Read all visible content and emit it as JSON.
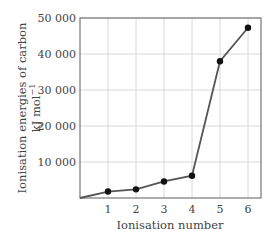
{
  "chart_data": {
    "type": "line",
    "title": "",
    "xlabel": "Ionisation number",
    "ylabel_line1": "Ionisation energies of carbon",
    "ylabel_line2": "kJ mol",
    "ylabel_superscript": "−1",
    "x": [
      0,
      1,
      2,
      3,
      4,
      5,
      6
    ],
    "x_ticks": [
      "1",
      "2",
      "3",
      "4",
      "5",
      "6"
    ],
    "y_ticks": [
      "10 000",
      "20 000",
      "30 000",
      "40 000",
      "50 000"
    ],
    "y_tick_values": [
      10000,
      20000,
      30000,
      40000,
      50000
    ],
    "series": [
      {
        "name": "Ionisation energies of carbon",
        "x": [
          1,
          2,
          3,
          4,
          5,
          6
        ],
        "values": [
          1800,
          2400,
          4600,
          6200,
          38000,
          47300
        ]
      }
    ],
    "starts_at_origin": true,
    "xlim": [
      0,
      6.5
    ],
    "ylim": [
      0,
      50000
    ],
    "grid": true,
    "legend": "none",
    "colors": {
      "line": "#555555",
      "marker": "#111111",
      "grid": "#d8d8d8",
      "frame": "#777777"
    }
  }
}
